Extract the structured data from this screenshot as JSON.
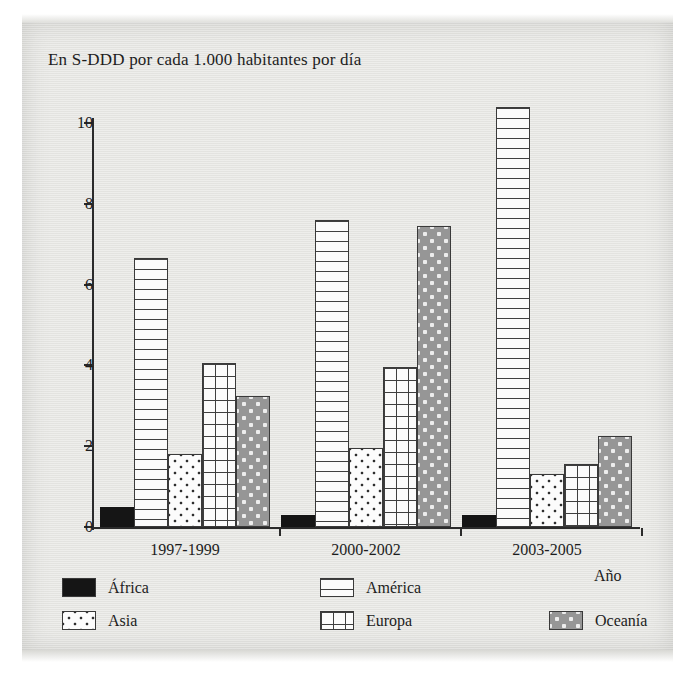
{
  "chart_data": {
    "type": "bar",
    "title": "En S-DDD por cada 1.000 habitantes por día",
    "xlabel": "Año",
    "ylabel": "",
    "categories": [
      "1997-1999",
      "2000-2002",
      "2003-2005"
    ],
    "ylim": [
      0,
      10.8
    ],
    "yticks": [
      "0",
      "2",
      "4",
      "6",
      "8",
      "10"
    ],
    "ytick_values": [
      0,
      2,
      4,
      6,
      8,
      10
    ],
    "grid": false,
    "legend_position": "below-axis",
    "series": [
      {
        "name": "África",
        "pattern": "solid-black",
        "values": [
          0.5,
          0.3,
          0.3
        ]
      },
      {
        "name": "América",
        "pattern": "horizontal-lines",
        "values": [
          6.65,
          7.6,
          10.4
        ]
      },
      {
        "name": "Asia",
        "pattern": "dots-on-white",
        "values": [
          1.8,
          1.95,
          1.3
        ]
      },
      {
        "name": "Europa",
        "pattern": "crosshatch-grid",
        "values": [
          4.05,
          3.95,
          1.55
        ]
      },
      {
        "name": "Oceanía",
        "pattern": "dots-on-gray",
        "values": [
          3.25,
          7.45,
          2.25
        ]
      }
    ]
  },
  "legend": {
    "items": [
      {
        "label": "África",
        "pattern": "solid-black"
      },
      {
        "label": "América",
        "pattern": "horizontal-lines"
      },
      {
        "label": "Asia",
        "pattern": "dots-on-white"
      },
      {
        "label": "Europa",
        "pattern": "crosshatch-grid"
      },
      {
        "label": "Oceanía",
        "pattern": "dots-on-gray"
      }
    ]
  },
  "colors": {
    "africa": "#151515",
    "oceania_fill": "#969696",
    "ink": "#1d1d1d",
    "axis": "#2b2b2b",
    "page": "#e9e9e6"
  }
}
